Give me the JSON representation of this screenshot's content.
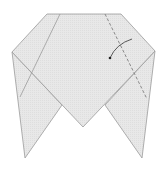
{
  "diagram": {
    "title": "",
    "paper_color": "#e6e6e6",
    "edge_color": "#9a9a9a",
    "dashed_color": "#8a8a8a",
    "arrow_color": "#333333",
    "annotations": {
      "fold_line": "valley fold (dashed)",
      "arrow": "fold direction arrow"
    }
  }
}
